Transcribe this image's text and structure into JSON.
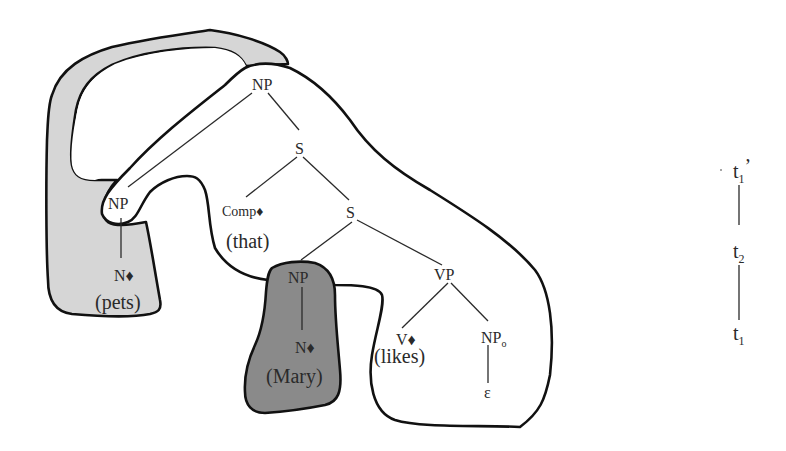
{
  "diagram": {
    "type": "syntax-tree-with-regions",
    "colors": {
      "background": "#ffffff",
      "light_region": "#d6d6d6",
      "dark_region": "#8a8a8a",
      "white_region": "#ffffff",
      "outline": "#111111",
      "text": "#2a2a2a"
    },
    "nodes": {
      "np_top": "NP",
      "s_upper": "S",
      "comp": "Comp",
      "comp_word": "(that)",
      "s_lower": "S",
      "np_left": "NP",
      "n_left": "N",
      "n_left_word": "(pets)",
      "np_subj": "NP",
      "n_subj": "N",
      "n_subj_word": "(Mary)",
      "vp": "VP",
      "v": "V",
      "v_word": "(likes)",
      "np_obj": "NP",
      "np_obj_sub": "o",
      "epsilon": "ε",
      "anchor_marker": "♦"
    },
    "edges": [
      [
        "np_top",
        "np_left"
      ],
      [
        "np_top",
        "s_upper"
      ],
      [
        "np_left",
        "n_left"
      ],
      [
        "s_upper",
        "comp"
      ],
      [
        "s_upper",
        "s_lower"
      ],
      [
        "s_lower",
        "np_subj"
      ],
      [
        "s_lower",
        "vp"
      ],
      [
        "np_subj",
        "n_subj"
      ],
      [
        "vp",
        "v"
      ],
      [
        "vp",
        "np_obj"
      ],
      [
        "np_obj",
        "epsilon"
      ]
    ],
    "regions": [
      {
        "name": "light-gray-region",
        "fill": "light"
      },
      {
        "name": "white-region",
        "fill": "white"
      },
      {
        "name": "dark-gray-region",
        "fill": "dark"
      }
    ]
  },
  "derivation": {
    "t1_prime": {
      "base": "t",
      "sub": "1",
      "prime": "’"
    },
    "t2": {
      "base": "t",
      "sub": "2"
    },
    "t1": {
      "base": "t",
      "sub": "1"
    }
  }
}
